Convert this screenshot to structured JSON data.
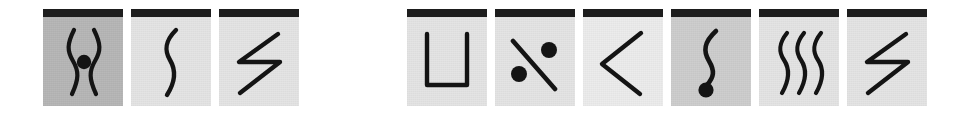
{
  "plate": {
    "title": "Symbol card plate",
    "background_color": "#ffffff",
    "card_bar_color": "#1d1d1d",
    "stroke_color": "#141414",
    "card_count": 9,
    "group_count": 2
  },
  "groups": [
    {
      "name": "left-group",
      "card_count": 3,
      "cards": [
        {
          "index": 1,
          "symbol_name": "double-wave-with-center-dot",
          "description": "Two mirrored vertical wavy lines enclosing a filled dot",
          "shade": "dark",
          "background_color": "#b6b6b6",
          "has_dot": true,
          "dot_position": "center"
        },
        {
          "index": 2,
          "symbol_name": "single-wave",
          "description": "Single vertical S-shaped wavy line",
          "shade": "light",
          "background_color": "#e4e4e4",
          "has_dot": false,
          "dot_position": "none"
        },
        {
          "index": 3,
          "symbol_name": "lightning-zigzag",
          "description": "Angular lightning bolt zigzag",
          "shade": "light",
          "background_color": "#e4e4e4",
          "has_dot": false,
          "dot_position": "none"
        }
      ]
    },
    {
      "name": "right-group",
      "card_count": 6,
      "cards": [
        {
          "index": 4,
          "symbol_name": "u-bracket",
          "description": "Square U-shaped bracket opening upward",
          "shade": "light",
          "background_color": "#e4e4e4",
          "has_dot": false,
          "dot_position": "none"
        },
        {
          "index": 5,
          "symbol_name": "percent-slash-two-dots",
          "description": "Diagonal slash with one dot upper-right and one dot lower-left",
          "shade": "light",
          "background_color": "#e4e4e4",
          "has_dot": true,
          "dot_position": "upper-right-and-lower-left"
        },
        {
          "index": 6,
          "symbol_name": "chevron-left",
          "description": "Angular less-than chevron pointing left",
          "shade": "lighter",
          "background_color": "#ececec",
          "has_dot": false,
          "dot_position": "none"
        },
        {
          "index": 7,
          "symbol_name": "wave-with-bottom-dot",
          "description": "Vertical wavy line terminating in a filled dot at the bottom",
          "shade": "mid",
          "background_color": "#cdcdcd",
          "has_dot": true,
          "dot_position": "bottom"
        },
        {
          "index": 8,
          "symbol_name": "triple-wave",
          "description": "Three parallel vertical wavy lines",
          "shade": "light",
          "background_color": "#e4e4e4",
          "has_dot": false,
          "dot_position": "none"
        },
        {
          "index": 9,
          "symbol_name": "lightning-zigzag",
          "description": "Angular lightning bolt zigzag",
          "shade": "light",
          "background_color": "#e4e4e4",
          "has_dot": false,
          "dot_position": "none"
        }
      ]
    }
  ]
}
